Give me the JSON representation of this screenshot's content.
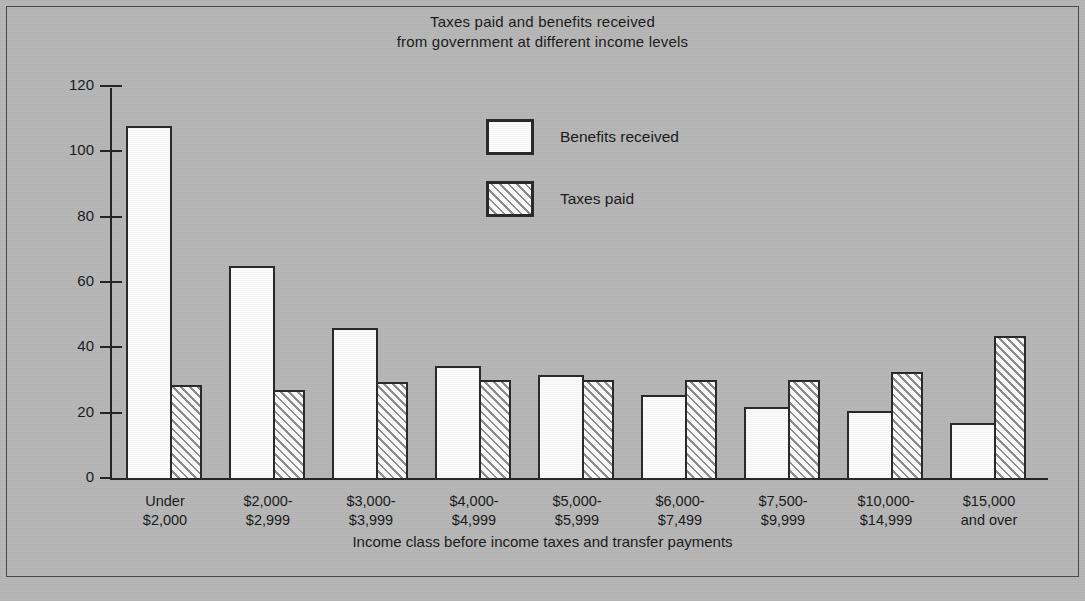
{
  "chart_data": {
    "type": "bar",
    "title": "Taxes paid and benefits received from government at different income levels",
    "title_lines": [
      "Taxes paid and benefits received",
      "from government at different income levels"
    ],
    "xlabel": "Income class before income taxes and transfer payments",
    "ylabel": "",
    "ylim": [
      0,
      120
    ],
    "yticks": [
      0,
      20,
      40,
      60,
      80,
      100,
      120
    ],
    "ytick_labels": [
      "0",
      "20",
      "40",
      "60",
      "80",
      "100",
      "120"
    ],
    "grid": false,
    "legend_position": "upper-right-inside",
    "categories": [
      [
        "Under",
        "$2,000"
      ],
      [
        "$2,000-",
        "$2,999"
      ],
      [
        "$3,000-",
        "$3,999"
      ],
      [
        "$4,000-",
        "$4,999"
      ],
      [
        "$5,000-",
        "$5,999"
      ],
      [
        "$6,000-",
        "$7,499"
      ],
      [
        "$7,500-",
        "$9,999"
      ],
      [
        "$10,000-",
        "$14,999"
      ],
      [
        "$15,000",
        "and over"
      ]
    ],
    "series": [
      {
        "name": "Benefits received",
        "fill": "solid-white",
        "values": [
          108.5,
          65.5,
          46.5,
          35.0,
          32.0,
          26.0,
          22.5,
          21.0,
          17.5
        ]
      },
      {
        "name": "Taxes paid",
        "fill": "diagonal-hatch",
        "values": [
          29.0,
          27.5,
          30.0,
          30.5,
          30.5,
          30.5,
          30.5,
          33.0,
          44.0
        ]
      }
    ],
    "colors": {
      "background": "#b7b7b7",
      "ink": "#2a2a2a",
      "bar_fill": "#fbfbfb",
      "hatch": "#8d8d8d"
    }
  },
  "legend": {
    "items": [
      {
        "label": "Benefits received"
      },
      {
        "label": "Taxes paid"
      }
    ]
  }
}
